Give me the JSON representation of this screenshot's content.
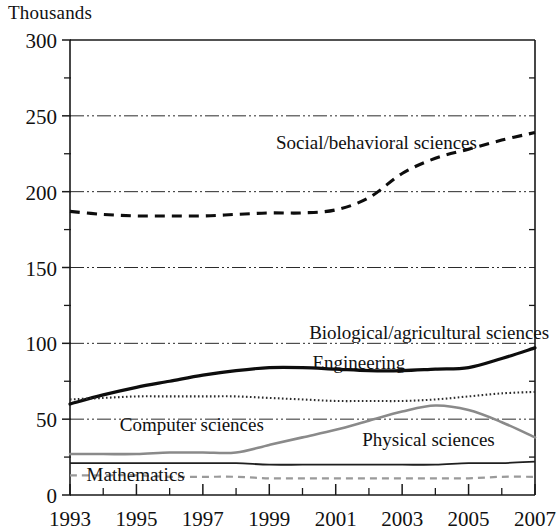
{
  "figure": {
    "unit_label": "Thousands"
  },
  "chart_data": {
    "type": "line",
    "title": "",
    "subtitle": "",
    "xlabel": "",
    "ylabel": "Thousands",
    "xlim": [
      1993,
      2007
    ],
    "ylim": [
      0,
      300
    ],
    "grid": true,
    "gridlines_y": [
      50,
      100,
      150,
      200,
      250,
      300
    ],
    "legend_position": "inline-annotations",
    "x": [
      1993,
      1994,
      1995,
      1996,
      1997,
      1998,
      1999,
      2000,
      2001,
      2002,
      2003,
      2004,
      2005,
      2006,
      2007
    ],
    "x_tick_labels": [
      "1993",
      "1995",
      "1997",
      "1999",
      "2001",
      "2003",
      "2005",
      "2007"
    ],
    "x_tick_values": [
      1993,
      1995,
      1997,
      1999,
      2001,
      2003,
      2005,
      2007
    ],
    "y_tick_labels": [
      "0",
      "50",
      "100",
      "150",
      "200",
      "250",
      "300"
    ],
    "y_tick_values": [
      0,
      50,
      100,
      150,
      200,
      250,
      300
    ],
    "y_minor_tick_values": [
      25,
      75,
      125,
      175,
      225,
      275
    ],
    "series": [
      {
        "name": "Social/behavioral sciences",
        "style": "dashed-thick",
        "color": "#0d0d0d",
        "label_text": "Social/behavioral sciences",
        "values": [
          187,
          185,
          184,
          184,
          184,
          185,
          186,
          186,
          188,
          196,
          212,
          222,
          228,
          234,
          239
        ]
      },
      {
        "name": "Biological/agricultural sciences",
        "style": "solid-thick",
        "color": "#0d0d0d",
        "label_text": "Biological/agricultural sciences",
        "values": [
          60,
          66,
          71,
          75,
          79,
          82,
          84,
          84,
          83,
          82,
          82,
          83,
          84,
          90,
          97
        ]
      },
      {
        "name": "Engineering",
        "style": "dotted",
        "color": "#2b2b2b",
        "label_text": "Engineering",
        "values": [
          63,
          64,
          65,
          65,
          65,
          65,
          64,
          63,
          62,
          62,
          62,
          63,
          65,
          67,
          68
        ]
      },
      {
        "name": "Computer sciences",
        "style": "solid-gray",
        "color": "#8a8a8a",
        "label_text": "Computer sciences",
        "values": [
          27,
          27,
          27,
          28,
          28,
          28,
          33,
          38,
          43,
          49,
          55,
          59,
          56,
          48,
          38
        ]
      },
      {
        "name": "Physical sciences",
        "style": "solid-thin",
        "color": "#1f1f1f",
        "label_text": "Physical sciences",
        "values": [
          21,
          21,
          21,
          21,
          21,
          21,
          20,
          20,
          20,
          20,
          20,
          20,
          21,
          21,
          22
        ]
      },
      {
        "name": "Mathematics",
        "style": "dashed-gray",
        "color": "#9a9a9a",
        "label_text": "Mathematics",
        "values": [
          13,
          13,
          13,
          12,
          12,
          12,
          11,
          11,
          11,
          11,
          11,
          11,
          11,
          12,
          12
        ]
      }
    ],
    "annotations": [
      {
        "text": "Social/behavioral sciences",
        "x": 1999.2,
        "y": 228
      },
      {
        "text": "Biological/agricultural sciences",
        "x": 2000.2,
        "y": 103
      },
      {
        "text": "Engineering",
        "x": 2000.3,
        "y": 83
      },
      {
        "text": "Computer sciences",
        "x": 1994.5,
        "y": 42
      },
      {
        "text": "Physical sciences",
        "x": 2001.8,
        "y": 32
      },
      {
        "text": "Mathematics",
        "x": 1993.5,
        "y": 9
      }
    ]
  }
}
